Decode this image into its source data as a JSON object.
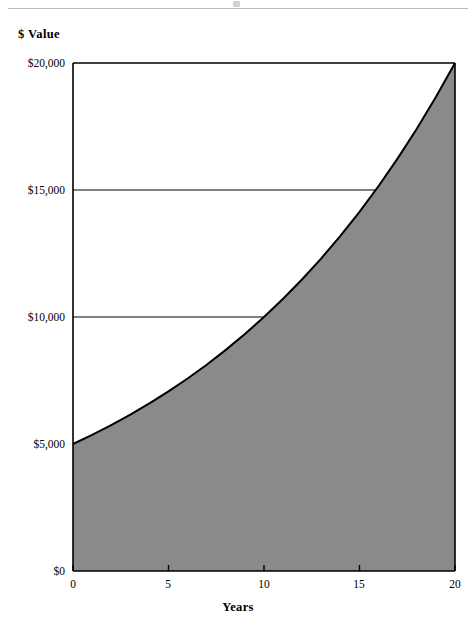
{
  "page": {
    "header_rule": true
  },
  "chart_data": {
    "type": "area",
    "title": "",
    "subtitle": "",
    "xlabel": "Years",
    "ylabel": "$ Value",
    "xlim": [
      0,
      20
    ],
    "ylim": [
      0,
      20000
    ],
    "xticks": [
      0,
      5,
      10,
      15,
      20
    ],
    "xtick_labels": [
      "0",
      "5",
      "10",
      "15",
      "20"
    ],
    "yticks": [
      0,
      5000,
      10000,
      15000,
      20000
    ],
    "ytick_labels": [
      "$0",
      "$5,000",
      "$10,000",
      "$15,000",
      "$20,000"
    ],
    "grid": true,
    "gridlines_at": [
      5000,
      10000,
      15000
    ],
    "legend": null,
    "legend_position": "none",
    "fill_color": "#8a8a8a",
    "line_color": "#000000",
    "axis_color": "#000000",
    "background_color": "#ffffff",
    "annotations": [],
    "series": [
      {
        "name": "Investment value",
        "description": "Compound growth of a $5,000 initial value to $20,000 over 20 years (about 7.18% annual rate)",
        "x": [
          0,
          1,
          2,
          3,
          4,
          5,
          6,
          7,
          8,
          9,
          10,
          11,
          12,
          13,
          14,
          15,
          16,
          17,
          18,
          19,
          20
        ],
        "values": [
          5000,
          5359,
          5744,
          6155,
          6597,
          7071,
          7578,
          8122,
          8705,
          9330,
          10000,
          10718,
          11487,
          12311,
          13195,
          14142,
          15157,
          16245,
          17411,
          18661,
          20000
        ]
      }
    ],
    "fill_baseline": 0,
    "key_points": [
      {
        "x": 0,
        "y": 5000,
        "note": "start"
      },
      {
        "x": 10,
        "y": 10000,
        "note": "crosses $10,000 gridline at year 10"
      },
      {
        "x": 15.6,
        "y": 15000,
        "note": "crosses $15,000 gridline"
      },
      {
        "x": 20,
        "y": 20000,
        "note": "ends at top-right corner"
      }
    ]
  }
}
